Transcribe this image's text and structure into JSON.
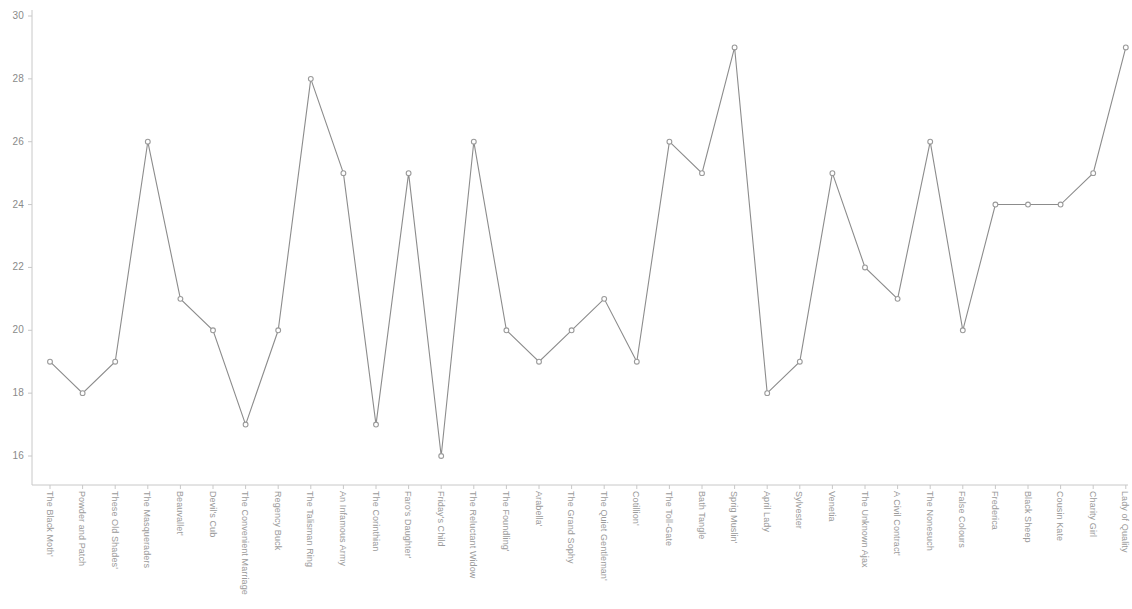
{
  "chart_data": {
    "type": "line",
    "title": "",
    "subtitle": "",
    "xlabel": "",
    "ylabel": "",
    "ylim": [
      16,
      30
    ],
    "xlim": [
      0,
      33
    ],
    "grid": false,
    "legend": "none",
    "y_ticks": [
      30,
      28,
      26,
      24,
      22,
      20,
      18,
      16
    ],
    "marker_style": "open-circle",
    "line_color": "#8c8c8c",
    "marker_fill": "#ffffff",
    "marker_stroke": "#9a9a9a",
    "axis_color": "#c8c8c8",
    "tick_label_color": "#8a8a8a",
    "categories": [
      "The Black Moth'",
      "Powder and Patch",
      "These Old Shades'",
      "The Masqueraders",
      "Beauvallet'",
      "Devil's Cub",
      "The Convenient Marriage",
      "Regency Buck",
      "The Talisman Ring",
      "An Infamous Army",
      "The Corinthian",
      "Faro's Daughter'",
      "Friday's Child",
      "The Reluctant Widow",
      "The Foundling'",
      "Arabella'",
      "The Grand Sophy",
      "The Quiet Gentleman'",
      "Cotillion'",
      "The Toll-Gate",
      "Bath Tangle",
      "Sprig Muslin'",
      "April Lady",
      "Sylvester",
      "Venetia",
      "The Unknown Ajax",
      "A Civil Contract'",
      "The Nonesuch",
      "False Colours",
      "Frederica",
      "Black Sheep",
      "Cousin Kate",
      "Charity Girl",
      "Lady of Quality"
    ],
    "values": [
      19,
      18,
      19,
      26,
      21,
      20,
      17,
      20,
      28,
      25,
      17,
      25,
      16,
      26,
      20,
      19,
      20,
      21,
      19,
      26,
      25,
      29,
      18,
      19,
      25,
      22,
      21,
      26,
      20,
      24,
      24,
      24,
      25,
      29
    ],
    "series": [
      {
        "name": "",
        "values": [
          19,
          18,
          19,
          26,
          21,
          20,
          17,
          20,
          28,
          25,
          17,
          25,
          16,
          26,
          20,
          19,
          20,
          21,
          19,
          26,
          25,
          29,
          18,
          19,
          25,
          22,
          21,
          26,
          20,
          24,
          24,
          24,
          25,
          29
        ]
      }
    ]
  }
}
